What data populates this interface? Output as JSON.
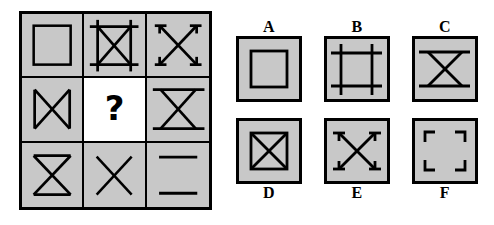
{
  "puzzle": {
    "type": "matrix-reasoning",
    "title": "3x3 visual analogy matrix with six answer options",
    "missing_cell": "row2-col2",
    "missing_marker": "?",
    "colors": {
      "cell_fill": "#c8c8c8",
      "question_cell_fill": "#ffffff",
      "stroke": "#000000",
      "page_background": "#ffffff"
    }
  },
  "matrix": {
    "rows": 3,
    "columns": 3,
    "cells": [
      {
        "id": "m1",
        "position": "r1c1",
        "figure": "square-outline",
        "description": "Plain square outline centered in cell"
      },
      {
        "id": "m2",
        "position": "r1c2",
        "figure": "square-extended-with-x",
        "description": "Square frame with extended corner lines plus an X inside"
      },
      {
        "id": "m3",
        "position": "r1c3",
        "figure": "x-with-t-caps",
        "description": "X with short perpendicular caps at all four ends"
      },
      {
        "id": "m4",
        "position": "r2c1",
        "figure": "bowtie-vertical-bars",
        "description": "X with vertical bars on left and right (horizontal bowtie)"
      },
      {
        "id": "m5",
        "position": "r2c2",
        "figure": "question-mark",
        "description": "Missing element, white background with bold question mark"
      },
      {
        "id": "m6",
        "position": "r2c3",
        "figure": "hourglass-extended-bars",
        "description": "X with extended horizontal bars at top and bottom"
      },
      {
        "id": "m7",
        "position": "r3c1",
        "figure": "hourglass",
        "description": "X with horizontal bars at top and bottom (hourglass)"
      },
      {
        "id": "m8",
        "position": "r3c2",
        "figure": "x-plain",
        "description": "Plain diagonal X"
      },
      {
        "id": "m9",
        "position": "r3c3",
        "figure": "two-horizontal-lines",
        "description": "Two horizontal lines, top and bottom, no X"
      }
    ]
  },
  "options": [
    {
      "id": "A",
      "label": "A",
      "label_position": "above",
      "figure": "square-outline",
      "description": "Square outline inside the box"
    },
    {
      "id": "B",
      "label": "B",
      "label_position": "above",
      "figure": "square-extended-frame",
      "description": "Square frame with extended corner lines, no X"
    },
    {
      "id": "C",
      "label": "C",
      "label_position": "above",
      "figure": "hourglass-extended-bars",
      "description": "X with extended horizontal bars at top and bottom"
    },
    {
      "id": "D",
      "label": "D",
      "label_position": "below",
      "figure": "square-with-x",
      "description": "Square outline containing an X"
    },
    {
      "id": "E",
      "label": "E",
      "label_position": "below",
      "figure": "x-with-t-caps",
      "description": "X with short perpendicular caps at all four ends"
    },
    {
      "id": "F",
      "label": "F",
      "label_position": "below",
      "figure": "four-corner-brackets",
      "description": "Four right-angle corner brackets"
    }
  ]
}
